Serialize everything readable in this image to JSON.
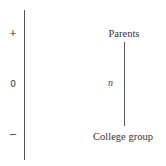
{
  "diagram": {
    "scale": {
      "ticks": [
        {
          "label": "+",
          "position": "top"
        },
        {
          "label": "0",
          "position": "middle"
        },
        {
          "label": "−",
          "position": "bottom"
        }
      ]
    },
    "nodes": {
      "top": "Parents",
      "bottom": "College group"
    },
    "edge": {
      "label": "n"
    }
  }
}
